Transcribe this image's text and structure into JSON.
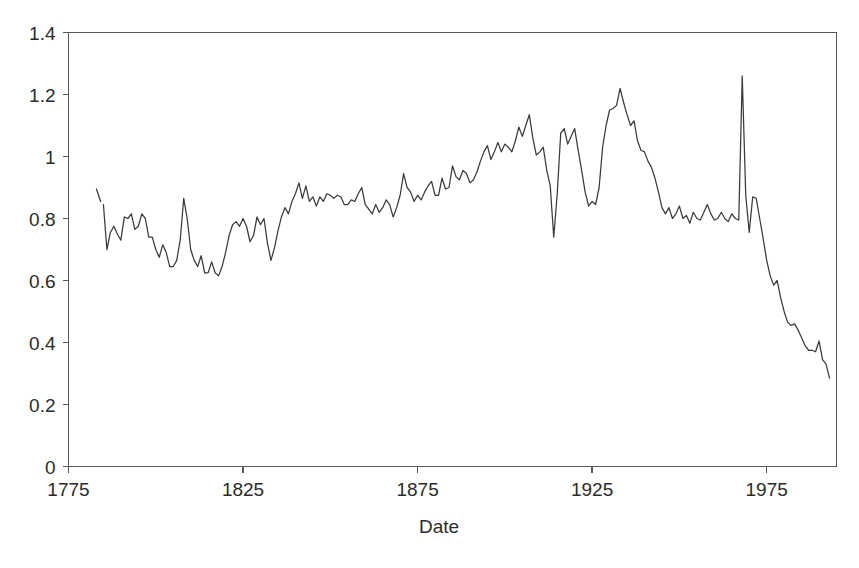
{
  "chart_data": {
    "type": "line",
    "title": "",
    "subtitle": "",
    "xlabel": "Date",
    "ylabel": "",
    "xlim": [
      1775,
      1995
    ],
    "ylim": [
      0,
      1.4
    ],
    "grid": false,
    "legend": null,
    "line_color": "#3a3a3c",
    "axis_color": "#555a5e",
    "x_ticks": [
      1775,
      1825,
      1875,
      1925,
      1975
    ],
    "x_tick_labels": [
      "1775",
      "1825",
      "1875",
      "1925",
      "1975"
    ],
    "y_ticks": [
      0,
      0.2,
      0.4,
      0.6,
      0.8,
      1,
      1.2,
      1.4
    ],
    "y_tick_labels": [
      "0",
      "0.2",
      "0.4",
      "0.6",
      "0.8",
      "1",
      "1.2",
      "1.4"
    ],
    "series": [
      {
        "name": "lead-segment",
        "x": [
          1783,
          1784.2
        ],
        "y": [
          0.895,
          0.855
        ]
      },
      {
        "name": "main",
        "x": [
          1785,
          1786,
          1787,
          1788,
          1789,
          1790,
          1791,
          1792,
          1793,
          1794,
          1795,
          1796,
          1797,
          1798,
          1799,
          1800,
          1801,
          1802,
          1803,
          1804,
          1805,
          1806,
          1807,
          1808,
          1809,
          1810,
          1811,
          1812,
          1813,
          1814,
          1815,
          1816,
          1817,
          1818,
          1819,
          1820,
          1821,
          1822,
          1823,
          1824,
          1825,
          1826,
          1827,
          1828,
          1829,
          1830,
          1831,
          1832,
          1833,
          1834,
          1835,
          1836,
          1837,
          1838,
          1839,
          1840,
          1841,
          1842,
          1843,
          1844,
          1845,
          1846,
          1847,
          1848,
          1849,
          1850,
          1851,
          1852,
          1853,
          1854,
          1855,
          1856,
          1857,
          1858,
          1859,
          1860,
          1861,
          1862,
          1863,
          1864,
          1865,
          1866,
          1867,
          1868,
          1869,
          1870,
          1871,
          1872,
          1873,
          1874,
          1875,
          1876,
          1877,
          1878,
          1879,
          1880,
          1881,
          1882,
          1883,
          1884,
          1885,
          1886,
          1887,
          1888,
          1889,
          1890,
          1891,
          1892,
          1893,
          1894,
          1895,
          1896,
          1897,
          1898,
          1899,
          1900,
          1901,
          1902,
          1903,
          1904,
          1905,
          1906,
          1907,
          1908,
          1909,
          1910,
          1911,
          1912,
          1913,
          1914,
          1915,
          1916,
          1917,
          1918,
          1919,
          1920,
          1921,
          1922,
          1923,
          1924,
          1925,
          1926,
          1927,
          1928,
          1929,
          1930,
          1931,
          1932,
          1933,
          1934,
          1935,
          1936,
          1937,
          1938,
          1939,
          1940,
          1941,
          1942,
          1943,
          1944,
          1945,
          1946,
          1947,
          1948,
          1949,
          1950,
          1951,
          1952,
          1953,
          1954,
          1955,
          1956,
          1957,
          1958,
          1959,
          1960,
          1961,
          1962,
          1963,
          1964,
          1965,
          1966,
          1967,
          1968,
          1969,
          1970,
          1971,
          1972,
          1973,
          1974,
          1975,
          1976,
          1977,
          1978,
          1979,
          1980,
          1981,
          1982,
          1983,
          1984,
          1985,
          1986,
          1987,
          1988,
          1989,
          1990,
          1991,
          1992,
          1993
        ],
        "y": [
          0.845,
          0.7,
          0.755,
          0.775,
          0.75,
          0.73,
          0.805,
          0.8,
          0.815,
          0.765,
          0.775,
          0.815,
          0.8,
          0.74,
          0.74,
          0.7,
          0.675,
          0.715,
          0.69,
          0.645,
          0.645,
          0.665,
          0.73,
          0.865,
          0.8,
          0.7,
          0.665,
          0.645,
          0.68,
          0.625,
          0.625,
          0.66,
          0.625,
          0.615,
          0.645,
          0.69,
          0.745,
          0.78,
          0.79,
          0.775,
          0.8,
          0.775,
          0.725,
          0.745,
          0.805,
          0.78,
          0.8,
          0.72,
          0.665,
          0.705,
          0.76,
          0.805,
          0.835,
          0.815,
          0.855,
          0.88,
          0.915,
          0.865,
          0.905,
          0.855,
          0.87,
          0.84,
          0.87,
          0.855,
          0.88,
          0.875,
          0.865,
          0.875,
          0.87,
          0.845,
          0.845,
          0.86,
          0.855,
          0.88,
          0.9,
          0.845,
          0.83,
          0.815,
          0.845,
          0.82,
          0.835,
          0.86,
          0.845,
          0.805,
          0.835,
          0.875,
          0.945,
          0.9,
          0.885,
          0.855,
          0.875,
          0.86,
          0.885,
          0.905,
          0.92,
          0.875,
          0.875,
          0.93,
          0.895,
          0.9,
          0.97,
          0.935,
          0.925,
          0.955,
          0.945,
          0.915,
          0.925,
          0.95,
          0.985,
          1.015,
          1.035,
          0.99,
          1.015,
          1.045,
          1.015,
          1.04,
          1.03,
          1.015,
          1.05,
          1.095,
          1.065,
          1.1,
          1.135,
          1.06,
          1.005,
          1.015,
          1.03,
          0.955,
          0.905,
          0.74,
          0.88,
          1.075,
          1.09,
          1.04,
          1.065,
          1.09,
          1.02,
          0.955,
          0.885,
          0.84,
          0.855,
          0.845,
          0.9,
          1.03,
          1.1,
          1.15,
          1.155,
          1.165,
          1.22,
          1.175,
          1.135,
          1.1,
          1.115,
          1.05,
          1.02,
          1.015,
          0.985,
          0.965,
          0.93,
          0.885,
          0.835,
          0.815,
          0.835,
          0.8,
          0.815,
          0.84,
          0.8,
          0.81,
          0.785,
          0.82,
          0.8,
          0.795,
          0.82,
          0.845,
          0.815,
          0.795,
          0.8,
          0.82,
          0.8,
          0.79,
          0.815,
          0.8,
          0.795,
          1.26,
          0.875,
          0.755,
          0.87,
          0.865,
          0.8,
          0.735,
          0.665,
          0.615,
          0.585,
          0.6,
          0.545,
          0.5,
          0.465,
          0.455,
          0.46,
          0.44,
          0.415,
          0.39,
          0.375,
          0.375,
          0.37,
          0.405,
          0.345,
          0.33,
          0.285
        ]
      }
    ]
  }
}
